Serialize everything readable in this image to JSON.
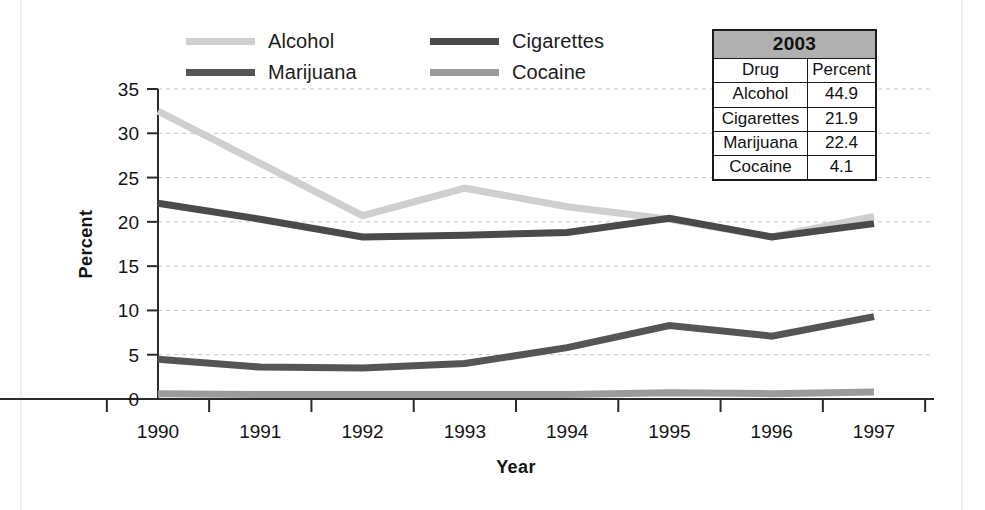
{
  "figure": {
    "background": "#ffffff",
    "plot_border_color": "#2b2b2b"
  },
  "legend": {
    "items": [
      {
        "label": "Alcohol",
        "color": "#cfcfcf"
      },
      {
        "label": "Cigarettes",
        "color": "#4a4a4a"
      },
      {
        "label": "Marijuana",
        "color": "#555555"
      },
      {
        "label": "Cocaine",
        "color": "#9b9b9b"
      }
    ]
  },
  "table": {
    "title": "2003",
    "headers": [
      "Drug",
      "Percent"
    ],
    "rows": [
      {
        "drug": "Alcohol",
        "percent": "44.9"
      },
      {
        "drug": "Cigarettes",
        "percent": "21.9"
      },
      {
        "drug": "Marijuana",
        "percent": "22.4"
      },
      {
        "drug": "Cocaine",
        "percent": "4.1"
      }
    ],
    "title_bg": "#b0b0b0"
  },
  "chart_data": {
    "type": "line",
    "title": "",
    "xlabel": "Year",
    "ylabel": "Percent",
    "categories": [
      "1990",
      "1991",
      "1992",
      "1993",
      "1994",
      "1995",
      "1996",
      "1997"
    ],
    "x": [
      1990,
      1991,
      1992,
      1993,
      1994,
      1995,
      1996,
      1997
    ],
    "ylim": [
      0,
      35
    ],
    "yticks": [
      0,
      5,
      10,
      15,
      20,
      25,
      30,
      35
    ],
    "ytick_labels": [
      "0",
      "5",
      "10",
      "15",
      "20",
      "25",
      "30",
      "35"
    ],
    "grid": true,
    "grid_style": "dashed",
    "grid_color": "#c8c8c8",
    "legend_position": "top-left",
    "series": [
      {
        "name": "Alcohol",
        "color": "#cfcfcf",
        "values": [
          32.5,
          26.6,
          20.7,
          23.8,
          21.7,
          20.3,
          18.3,
          20.6
        ]
      },
      {
        "name": "Cigarettes",
        "color": "#4a4a4a",
        "values": [
          22.1,
          20.3,
          18.3,
          18.5,
          18.8,
          20.4,
          18.3,
          19.8
        ]
      },
      {
        "name": "Marijuana",
        "color": "#555555",
        "values": [
          4.5,
          3.6,
          3.5,
          4.0,
          5.8,
          8.3,
          7.1,
          9.3
        ]
      },
      {
        "name": "Cocaine",
        "color": "#9b9b9b",
        "values": [
          0.6,
          0.5,
          0.5,
          0.5,
          0.5,
          0.7,
          0.6,
          0.8
        ]
      }
    ]
  }
}
